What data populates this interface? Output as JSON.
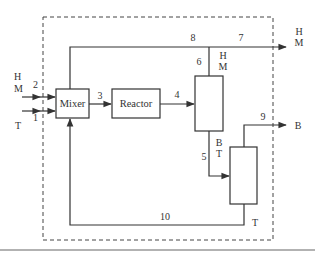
{
  "diagram": {
    "title": "",
    "units": {
      "mixer": "Mixer",
      "reactor": "Reactor"
    },
    "streams": {
      "s1": "1",
      "s2": "2",
      "s3": "3",
      "s4": "4",
      "s5": "5",
      "s6": "6",
      "s7": "7",
      "s8": "8",
      "s9": "9",
      "s10": "10"
    },
    "components": {
      "feed2_top": "H",
      "feed2_bottom": "M",
      "feed1": "T",
      "out7_top": "H",
      "out7_bottom": "M",
      "col1_top_top": "H",
      "col1_top_bottom": "M",
      "col1_bot_top": "B",
      "col1_bot_bottom": "T",
      "out9": "B",
      "col2_bot": "T"
    },
    "colors": {
      "line": "#333333",
      "boundary": "#444444",
      "rule": "#999999"
    }
  }
}
